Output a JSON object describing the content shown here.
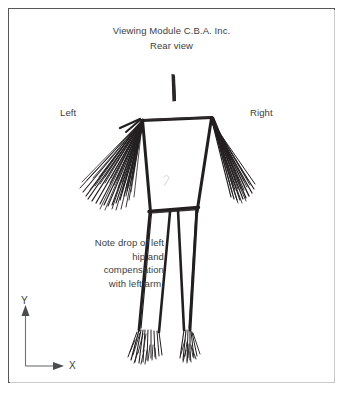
{
  "document": {
    "title_line1": "Viewing Module C.B.A. Inc.",
    "title_line2": "Rear view"
  },
  "labels": {
    "left": "Left",
    "right": "Right"
  },
  "annotation": {
    "text": "Note drop of left\nhip and\ncompensation\nwith left arm."
  },
  "axes": {
    "y_label": "Y",
    "x_label": "X"
  },
  "colors": {
    "ink": "#231f20",
    "text": "#3b3d3f",
    "frame": "#56585a",
    "frame_shadow": "#c9cacc",
    "axis": "#6e7073",
    "background": "#ffffff"
  },
  "figure": {
    "view": "rear",
    "head_marker": "vertical-bar",
    "parts": [
      "head",
      "shoulders",
      "torso",
      "left-arm",
      "right-arm",
      "hip-line",
      "left-leg",
      "right-leg",
      "feet"
    ],
    "left_arm_style": "wide-motion-blur-fan",
    "right_arm_style": "narrow-motion-blur-fan",
    "hip_tilt": "drops-to-left"
  }
}
